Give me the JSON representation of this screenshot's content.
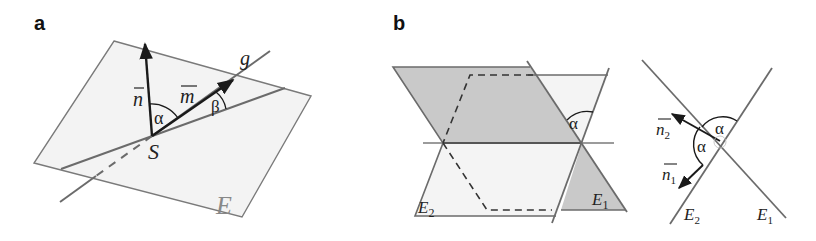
{
  "panels": {
    "a": {
      "label": "a",
      "plane_label": "E",
      "line_label": "g",
      "point_label": "S",
      "normal_vector": "n",
      "direction_vector": "m",
      "angle_n_m": "α",
      "angle_line_plane": "β"
    },
    "b": {
      "label": "b",
      "plane1_label": "E",
      "plane1_sub": "1",
      "plane2_label": "E",
      "plane2_sub": "2",
      "angle_between_planes": "α",
      "side_view": {
        "plane1_label": "E",
        "plane1_sub": "1",
        "plane2_label": "E",
        "plane2_sub": "2",
        "normal1": "n",
        "normal1_sub": "1",
        "normal2": "n",
        "normal2_sub": "2",
        "angle_top": "α",
        "angle_left": "α"
      }
    }
  },
  "colors": {
    "line": "#6b6b6b",
    "vector": "#1a1a1a",
    "plane_light": "#f2f2f2",
    "plane_dark": "#c8c8c8"
  }
}
